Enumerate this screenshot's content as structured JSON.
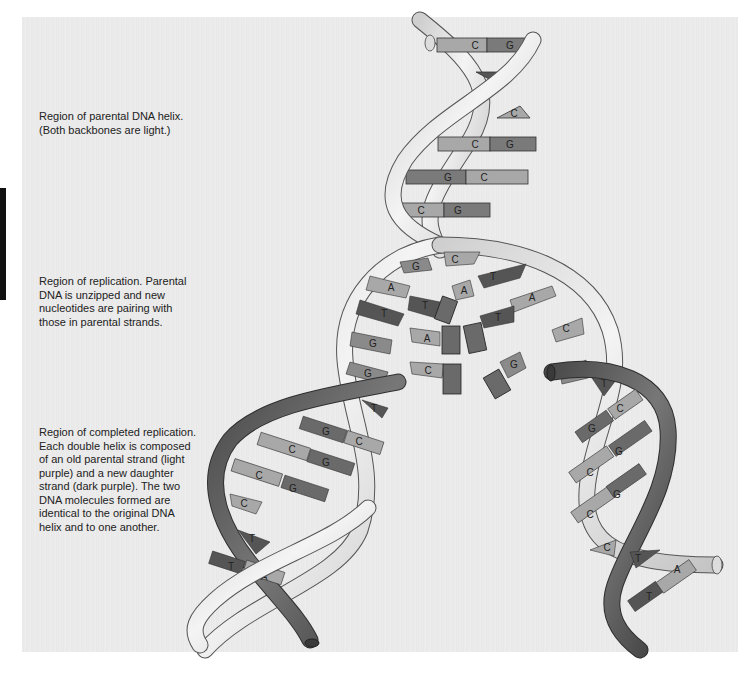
{
  "figure": {
    "type": "DNA replication diagram",
    "colors": {
      "background": "#ebebeb",
      "parental_backbone": "#dcdcdc",
      "daughter_backbone": "#5e5e5e",
      "base_light": "#a8a8a8",
      "base_medium": "#8a8a8a",
      "base_dark": "#5a5a5a",
      "side_tab": "#111111"
    }
  },
  "labels": {
    "parental_region": "Region of parental DNA helix.\n(Both backbones are light.)",
    "replication_region": "Region of replication.  Parental\nDNA is unzipped and new\nnucleotides are pairing with\nthose in parental strands.",
    "completed_region": "Region of completed replication.\nEach double helix is composed\nof an old parental strand (light\npurple) and a new daughter\nstrand (dark purple).  The two\nDNA molecules formed are\nidentical to the original DNA\nhelix and to one another."
  },
  "parental_helix": {
    "base_pairs": [
      {
        "left": "C",
        "right": "G"
      },
      {
        "left": "T",
        "right": ""
      },
      {
        "left": "C",
        "right": ""
      },
      {
        "left": "C",
        "right": "G"
      },
      {
        "left": "G",
        "right": "C"
      },
      {
        "left": "C",
        "right": "G"
      }
    ]
  },
  "replication_fork": {
    "left_strand_bases": [
      "G",
      "A",
      "T",
      "G",
      "G",
      "T"
    ],
    "right_strand_bases": [
      "C",
      "T",
      "A",
      "C",
      "G",
      "T"
    ],
    "free_nucleotides": [
      "T",
      "A",
      "A",
      "T",
      "C",
      "G"
    ]
  },
  "left_daughter_helix": {
    "base_pairs": [
      {
        "left": "G",
        "right": "C"
      },
      {
        "left": "C",
        "right": "G"
      },
      {
        "left": "C",
        "right": "G"
      },
      {
        "left": "C",
        "right": ""
      },
      {
        "left": "T",
        "right": ""
      },
      {
        "left": "T",
        "right": "A"
      }
    ]
  },
  "right_daughter_helix": {
    "base_pairs": [
      {
        "left": "G",
        "right": "C"
      },
      {
        "left": "C",
        "right": "G"
      },
      {
        "left": "C",
        "right": "G"
      },
      {
        "left": "C",
        "right": ""
      },
      {
        "left": "T",
        "right": ""
      },
      {
        "left": "T",
        "right": "A"
      }
    ]
  }
}
